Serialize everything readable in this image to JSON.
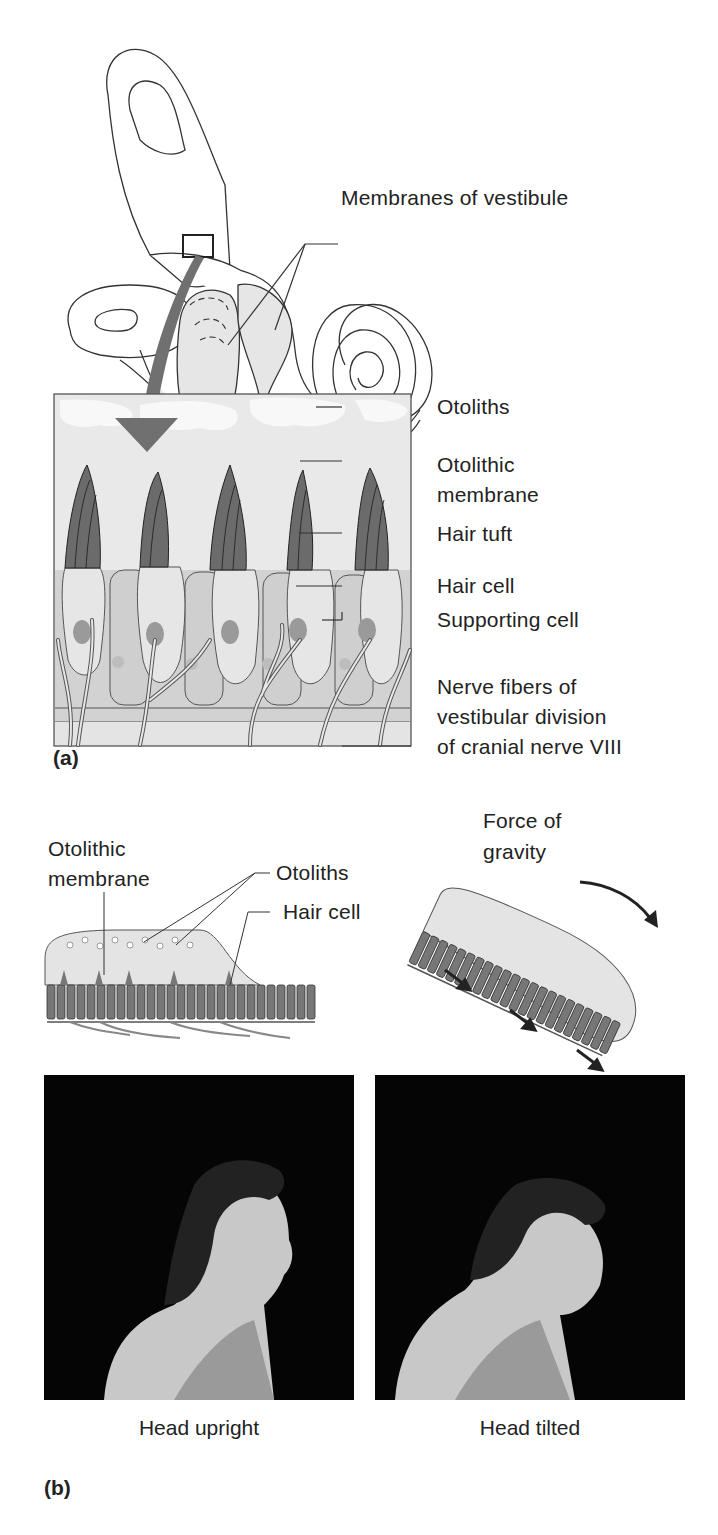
{
  "panel_a": {
    "label": "(a)",
    "labels": {
      "membranes_of_vestibule": "Membranes of vestibule",
      "otoliths": "Otoliths",
      "otolithic_membrane_1": "Otolithic",
      "otolithic_membrane_2": "membrane",
      "hair_tuft": "Hair tuft",
      "hair_cell": "Hair cell",
      "supporting_cell": "Supporting cell",
      "nerve_fibers_1": "Nerve fibers of",
      "nerve_fibers_2": "vestibular division",
      "nerve_fibers_3": "of cranial nerve VIII"
    }
  },
  "panel_b": {
    "label": "(b)",
    "labels": {
      "otolithic_membrane_1": "Otolithic",
      "otolithic_membrane_2": "membrane",
      "otoliths": "Otoliths",
      "hair_cell": "Hair cell",
      "force_of_gravity_1": "Force of",
      "force_of_gravity_2": "gravity"
    },
    "photos": [
      {
        "caption": "Head upright"
      },
      {
        "caption": "Head tilted"
      }
    ]
  },
  "colors": {
    "line": "#333333",
    "fill_light": "#e6e6e6",
    "fill_mid": "#cfcfcf",
    "tuft": "#6b6b6b",
    "arrow": "#707070",
    "nucleus": "#9a9a9a",
    "photo_bg": "#050505"
  }
}
